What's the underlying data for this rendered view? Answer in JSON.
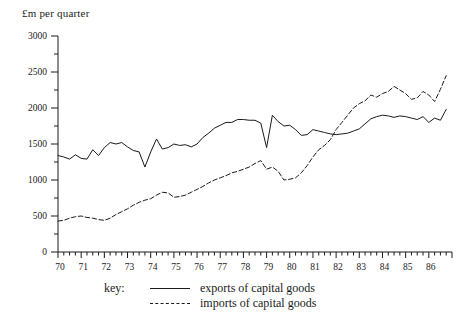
{
  "chart_data": {
    "type": "line",
    "title": "",
    "ylabel": "£m per quarter",
    "xlabel": "",
    "ylim": [
      0,
      3000
    ],
    "ytick_step": 500,
    "yminor_step": 250,
    "yticks": [
      "0",
      "500",
      "1000",
      "1500",
      "2000",
      "2500",
      "3000"
    ],
    "xlim": [
      70,
      87
    ],
    "xticks": [
      "70",
      "71",
      "72",
      "73",
      "74",
      "75",
      "76",
      "77",
      "78",
      "79",
      "80",
      "81",
      "82",
      "83",
      "84",
      "85",
      "86"
    ],
    "x_minor": "quarterly",
    "grid": false,
    "legend_position": "below-axes",
    "legend_title": "key:",
    "series": [
      {
        "name": "exports of capital goods",
        "style": "solid",
        "color": "#1a1a1a",
        "x": [
          70.0,
          70.25,
          70.5,
          70.75,
          71.0,
          71.25,
          71.5,
          71.75,
          72.0,
          72.25,
          72.5,
          72.75,
          73.0,
          73.25,
          73.5,
          73.75,
          74.0,
          74.25,
          74.5,
          74.75,
          75.0,
          75.25,
          75.5,
          75.75,
          76.0,
          76.25,
          76.5,
          76.75,
          77.0,
          77.25,
          77.5,
          77.75,
          78.0,
          78.25,
          78.5,
          78.75,
          79.0,
          79.25,
          79.5,
          79.75,
          80.0,
          80.25,
          80.5,
          80.75,
          81.0,
          81.25,
          81.5,
          81.75,
          82.0,
          82.25,
          82.5,
          82.75,
          83.0,
          83.25,
          83.5,
          83.75,
          84.0,
          84.25,
          84.5,
          84.75,
          85.0,
          85.25,
          85.5,
          85.75,
          86.0,
          86.25,
          86.5,
          86.75
        ],
        "values": [
          1340,
          1320,
          1290,
          1350,
          1300,
          1290,
          1420,
          1340,
          1450,
          1520,
          1500,
          1520,
          1460,
          1410,
          1390,
          1180,
          1390,
          1570,
          1430,
          1450,
          1500,
          1480,
          1490,
          1460,
          1500,
          1590,
          1650,
          1720,
          1760,
          1800,
          1800,
          1840,
          1840,
          1830,
          1830,
          1790,
          1450,
          1900,
          1810,
          1750,
          1760,
          1700,
          1620,
          1630,
          1700,
          1680,
          1660,
          1640,
          1630,
          1640,
          1650,
          1680,
          1710,
          1780,
          1850,
          1880,
          1900,
          1890,
          1870,
          1890,
          1880,
          1860,
          1840,
          1880,
          1800,
          1860,
          1830,
          1980
        ]
      },
      {
        "name": "imports of capital goods",
        "style": "dashed",
        "color": "#1a1a1a",
        "x": [
          70.0,
          70.25,
          70.5,
          70.75,
          71.0,
          71.25,
          71.5,
          71.75,
          72.0,
          72.25,
          72.5,
          72.75,
          73.0,
          73.25,
          73.5,
          73.75,
          74.0,
          74.25,
          74.5,
          74.75,
          75.0,
          75.25,
          75.5,
          75.75,
          76.0,
          76.25,
          76.5,
          76.75,
          77.0,
          77.25,
          77.5,
          77.75,
          78.0,
          78.25,
          78.5,
          78.75,
          79.0,
          79.25,
          79.5,
          79.75,
          80.0,
          80.25,
          80.5,
          80.75,
          81.0,
          81.25,
          81.5,
          81.75,
          82.0,
          82.25,
          82.5,
          82.75,
          83.0,
          83.25,
          83.5,
          83.75,
          84.0,
          84.25,
          84.5,
          84.75,
          85.0,
          85.25,
          85.5,
          85.75,
          86.0,
          86.25,
          86.5,
          86.75
        ],
        "values": [
          430,
          440,
          470,
          490,
          500,
          480,
          470,
          450,
          440,
          470,
          520,
          560,
          600,
          650,
          690,
          720,
          740,
          790,
          830,
          820,
          760,
          770,
          790,
          830,
          870,
          910,
          960,
          1000,
          1030,
          1060,
          1100,
          1120,
          1150,
          1180,
          1230,
          1270,
          1150,
          1180,
          1120,
          1000,
          1010,
          1030,
          1100,
          1200,
          1320,
          1420,
          1480,
          1560,
          1700,
          1800,
          1900,
          2000,
          2060,
          2100,
          2180,
          2150,
          2200,
          2230,
          2300,
          2250,
          2200,
          2120,
          2140,
          2230,
          2180,
          2090,
          2260,
          2450
        ]
      }
    ]
  },
  "legend": {
    "key_label": "key:",
    "entries": [
      {
        "label": "exports of capital goods",
        "style": "solid"
      },
      {
        "label": "imports of capital goods",
        "style": "dashed"
      }
    ]
  }
}
